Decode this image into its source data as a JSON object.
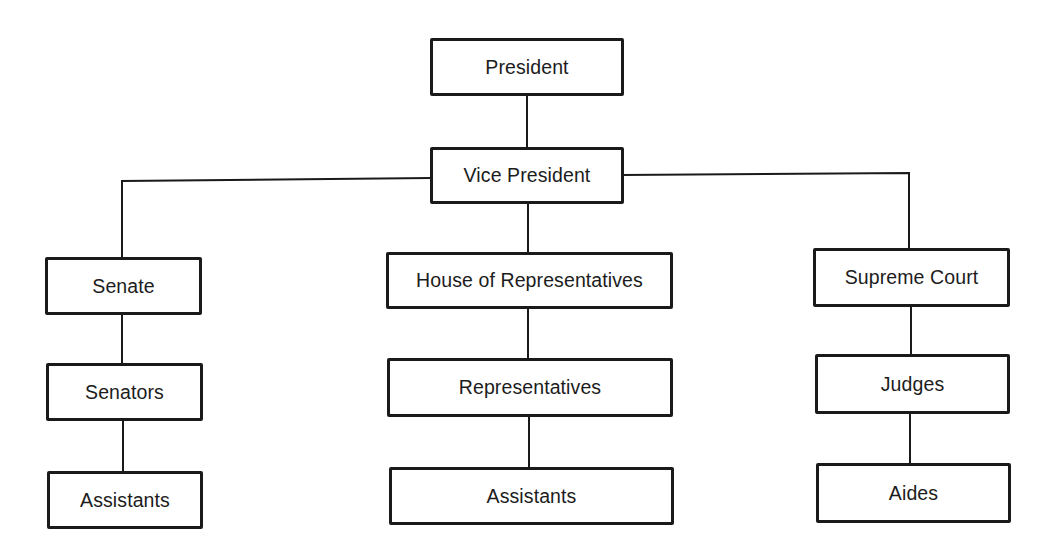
{
  "diagram": {
    "type": "org-chart",
    "nodes": {
      "president": {
        "label": "President"
      },
      "vice_president": {
        "label": "Vice President"
      },
      "senate": {
        "label": "Senate"
      },
      "senators": {
        "label": "Senators"
      },
      "senate_assistants": {
        "label": "Assistants"
      },
      "house": {
        "label": "House of Representatives"
      },
      "representatives": {
        "label": "Representatives"
      },
      "house_assistants": {
        "label": "Assistants"
      },
      "supreme_court": {
        "label": "Supreme Court"
      },
      "judges": {
        "label": "Judges"
      },
      "aides": {
        "label": "Aides"
      }
    },
    "edges": [
      [
        "President",
        "Vice President"
      ],
      [
        "Vice President",
        "Senate"
      ],
      [
        "Vice President",
        "House of Representatives"
      ],
      [
        "Vice President",
        "Supreme Court"
      ],
      [
        "Senate",
        "Senators"
      ],
      [
        "Senators",
        "Assistants"
      ],
      [
        "House of Representatives",
        "Representatives"
      ],
      [
        "Representatives",
        "Assistants"
      ],
      [
        "Supreme Court",
        "Judges"
      ],
      [
        "Judges",
        "Aides"
      ]
    ]
  }
}
